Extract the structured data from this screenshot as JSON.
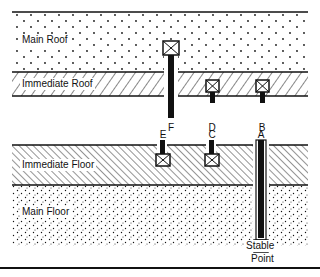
{
  "diagram": {
    "type": "mine roof/floor strata cross-section with anchor points",
    "layers": {
      "main_roof": "Main Roof",
      "immediate_roof": "Immediate Roof",
      "immediate_floor": "Immediate Floor",
      "main_floor": "Main Floor"
    },
    "anchors": {
      "A": "A",
      "B": "B",
      "C": "C",
      "D": "D",
      "E": "E",
      "F": "F"
    },
    "stable_point": {
      "line1": "Stable",
      "line2": "Point"
    },
    "colors": {
      "ink": "#111111",
      "background": "#ffffff"
    }
  }
}
